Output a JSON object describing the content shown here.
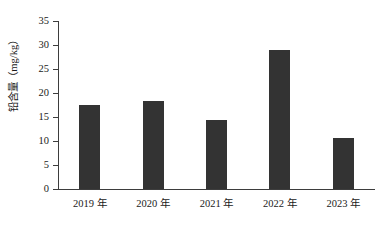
{
  "chart_data": {
    "type": "bar",
    "title": "",
    "xlabel": "",
    "ylabel": "铅含量（mg/kg）",
    "categories": [
      "2019 年",
      "2020 年",
      "2021 年",
      "2022 年",
      "2023 年"
    ],
    "values": [
      17.5,
      18.3,
      14.3,
      28.9,
      10.7
    ],
    "series": [
      {
        "name": "铅含量",
        "values": [
          17.5,
          18.3,
          14.3,
          28.9,
          10.7
        ]
      }
    ],
    "ylim": [
      0,
      35
    ],
    "ytick_values": [
      0,
      5,
      10,
      15,
      20,
      25,
      30,
      35
    ],
    "ytick_labels": [
      "0",
      "5",
      "10",
      "15",
      "20",
      "25",
      "30",
      "35"
    ],
    "grid": false,
    "legend": false,
    "legend_position": "none",
    "bar_color": "#333333",
    "axis_color": "#3d3d3d",
    "background_color": "#ffffff"
  }
}
